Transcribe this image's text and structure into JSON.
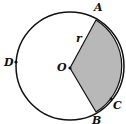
{
  "diagram": {
    "type": "circle-sector",
    "labels": {
      "A": "A",
      "B": "B",
      "C": "C",
      "D": "D",
      "O": "O",
      "r": "r"
    },
    "colors": {
      "stroke": "#111111",
      "sector_fill": "#b8b8b8",
      "background": "#ffffff"
    },
    "center": [
      70,
      68
    ],
    "radius": 52,
    "points": {
      "A": [
        96,
        19
      ],
      "B": [
        96,
        113
      ],
      "C": [
        112,
        99
      ],
      "D": [
        16,
        62
      ]
    }
  }
}
